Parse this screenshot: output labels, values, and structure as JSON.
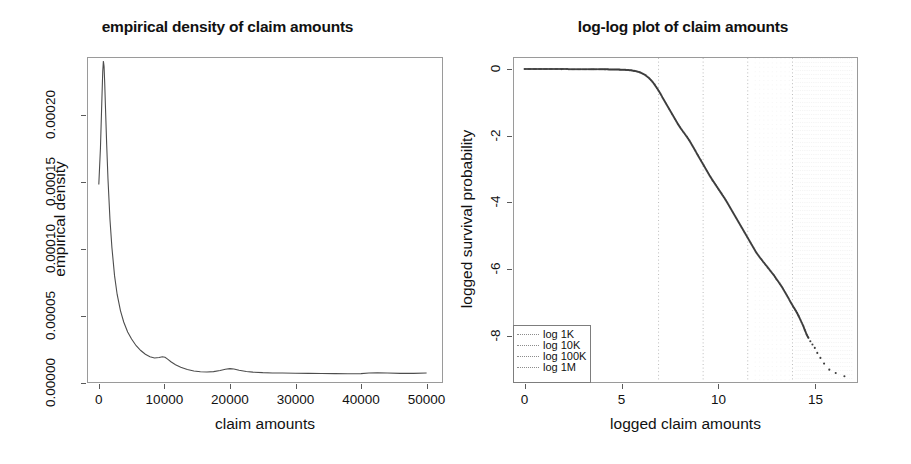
{
  "figure": {
    "panel_count": 2,
    "background_color": "#ffffff",
    "axis_color": "#9a9a9a",
    "curve_color": "#4d4d4d",
    "grid_color": "#c8c8c8"
  },
  "left_panel": {
    "title": "empirical density of claim amounts",
    "xlabel": "claim amounts",
    "ylabel": "empirical density",
    "x_ticklabels": [
      "0",
      "10000",
      "20000",
      "30000",
      "40000",
      "50000"
    ],
    "y_ticklabels": [
      "0.00000",
      "0.00005",
      "0.00010",
      "0.00015",
      "0.00020"
    ]
  },
  "right_panel": {
    "title": "log-log plot of claim amounts",
    "xlabel": "logged claim amounts",
    "ylabel": "logged survival probability",
    "x_ticklabels": [
      "0",
      "5",
      "10",
      "15"
    ],
    "y_ticklabels": [
      "0",
      "-2",
      "-4",
      "-6",
      "-8"
    ],
    "legend": {
      "entries": [
        {
          "label": "log 1K",
          "style": "dotted"
        },
        {
          "label": "log 10K",
          "style": "dotted"
        },
        {
          "label": "log 100K",
          "style": "dotted"
        },
        {
          "label": "log 1M",
          "style": "dotted"
        }
      ]
    }
  },
  "chart_data": [
    {
      "type": "line",
      "id": "empirical-density",
      "title": "empirical density of claim amounts",
      "xlabel": "claim amounts",
      "ylabel": "empirical density",
      "xlim": [
        -1800,
        52500
      ],
      "ylim": [
        0.0,
        0.000243
      ],
      "xticks": [
        0,
        10000,
        20000,
        30000,
        40000,
        50000
      ],
      "yticks": [
        0.0,
        5e-05,
        0.0001,
        0.00015,
        0.0002
      ],
      "grid": false,
      "legend": "none",
      "x": [
        0,
        250,
        450,
        600,
        700,
        800,
        900,
        1000,
        1200,
        1400,
        1700,
        2000,
        2400,
        2800,
        3300,
        3800,
        4400,
        5000,
        5700,
        6400,
        7100,
        7800,
        8500,
        9200,
        9700,
        10100,
        10500,
        11000,
        11700,
        12500,
        13500,
        14500,
        15500,
        16500,
        17500,
        18500,
        19300,
        20000,
        20600,
        21400,
        22500,
        23500,
        25000,
        26500,
        28000,
        30000,
        32000,
        34000,
        36000,
        38000,
        40000,
        41200,
        42500,
        44000,
        46000,
        48000,
        50000
      ],
      "y": [
        0.000148,
        0.000175,
        0.000208,
        0.000232,
        0.00024,
        0.000236,
        0.000224,
        0.000208,
        0.000178,
        0.000152,
        0.000122,
        0.000101,
        8e-05,
        6.6e-05,
        5.4e-05,
        4.55e-05,
        3.8e-05,
        3.28e-05,
        2.78e-05,
        2.42e-05,
        2.14e-05,
        1.96e-05,
        1.86e-05,
        1.9e-05,
        1.96e-05,
        1.92e-05,
        1.78e-05,
        1.58e-05,
        1.36e-05,
        1.18e-05,
        1.01e-05,
        9e-06,
        8.4e-06,
        8.2e-06,
        8.5e-06,
        9.3e-06,
        1.02e-05,
        1.07e-05,
        1.04e-05,
        9.5e-06,
        8.6e-06,
        8.1e-06,
        7.7e-06,
        7.5e-06,
        7.4e-06,
        7.3e-06,
        7.2e-06,
        7.1e-06,
        7e-06,
        6.9e-06,
        7e-06,
        7.4e-06,
        7.6e-06,
        7.4e-06,
        7.2e-06,
        7.2e-06,
        7.4e-06
      ]
    },
    {
      "type": "scatter",
      "id": "log-log-survival",
      "title": "log-log plot of claim amounts",
      "xlabel": "logged claim amounts",
      "ylabel": "logged survival probability",
      "xlim": [
        -0.6,
        17.2
      ],
      "ylim": [
        -9.4,
        0.35
      ],
      "xticks": [
        0,
        5,
        10,
        15
      ],
      "yticks": [
        0,
        -2,
        -4,
        -6,
        -8
      ],
      "grid": "vertical-dotted",
      "gridlines_x": [
        6.91,
        9.21,
        11.51,
        13.82
      ],
      "gridline_labels": [
        "log 1K",
        "log 10K",
        "log 100K",
        "log 1M"
      ],
      "legend": "inside-bottom-left",
      "x": [
        0.0,
        1.9,
        3.4,
        3.6,
        3.85,
        4.0,
        4.15,
        4.3,
        4.45,
        4.6,
        4.75,
        4.9,
        5.05,
        5.2,
        5.35,
        5.5,
        5.65,
        5.8,
        5.95,
        6.1,
        6.25,
        6.4,
        6.55,
        6.7,
        6.85,
        7.0,
        7.15,
        7.3,
        7.45,
        7.6,
        7.75,
        7.9,
        8.05,
        8.2,
        8.35,
        8.5,
        8.65,
        8.8,
        8.95,
        9.1,
        9.25,
        9.4,
        9.55,
        9.7,
        9.85,
        10.0,
        10.15,
        10.3,
        10.45,
        10.6,
        10.75,
        10.9,
        11.05,
        11.2,
        11.35,
        11.5,
        11.65,
        11.8,
        11.95,
        12.1,
        12.25,
        12.4,
        12.55,
        12.7,
        12.85,
        13.0,
        13.15,
        13.3,
        13.45,
        13.6,
        13.72,
        13.84,
        13.95,
        14.05,
        14.14,
        14.22,
        14.3,
        14.38,
        14.46,
        14.55,
        14.64,
        14.74,
        14.85,
        14.97,
        15.1,
        15.26,
        15.45,
        15.72,
        16.05,
        16.5
      ],
      "y": [
        -0.01,
        -0.012,
        -0.015,
        -0.016,
        -0.017,
        -0.018,
        -0.019,
        -0.02,
        -0.022,
        -0.024,
        -0.026,
        -0.028,
        -0.031,
        -0.035,
        -0.04,
        -0.05,
        -0.065,
        -0.085,
        -0.11,
        -0.15,
        -0.2,
        -0.27,
        -0.36,
        -0.47,
        -0.6,
        -0.74,
        -0.9,
        -1.05,
        -1.2,
        -1.35,
        -1.5,
        -1.65,
        -1.78,
        -1.9,
        -2.02,
        -2.15,
        -2.3,
        -2.45,
        -2.6,
        -2.75,
        -2.9,
        -3.05,
        -3.2,
        -3.34,
        -3.47,
        -3.6,
        -3.73,
        -3.86,
        -4.0,
        -4.15,
        -4.3,
        -4.45,
        -4.6,
        -4.75,
        -4.9,
        -5.05,
        -5.2,
        -5.35,
        -5.5,
        -5.62,
        -5.73,
        -5.84,
        -5.95,
        -6.06,
        -6.17,
        -6.3,
        -6.42,
        -6.55,
        -6.7,
        -6.85,
        -6.98,
        -7.1,
        -7.2,
        -7.3,
        -7.4,
        -7.5,
        -7.6,
        -7.7,
        -7.82,
        -7.95,
        -8.05,
        -8.15,
        -8.25,
        -8.35,
        -8.5,
        -8.65,
        -8.82,
        -9.0,
        -9.1,
        -9.2
      ]
    }
  ]
}
